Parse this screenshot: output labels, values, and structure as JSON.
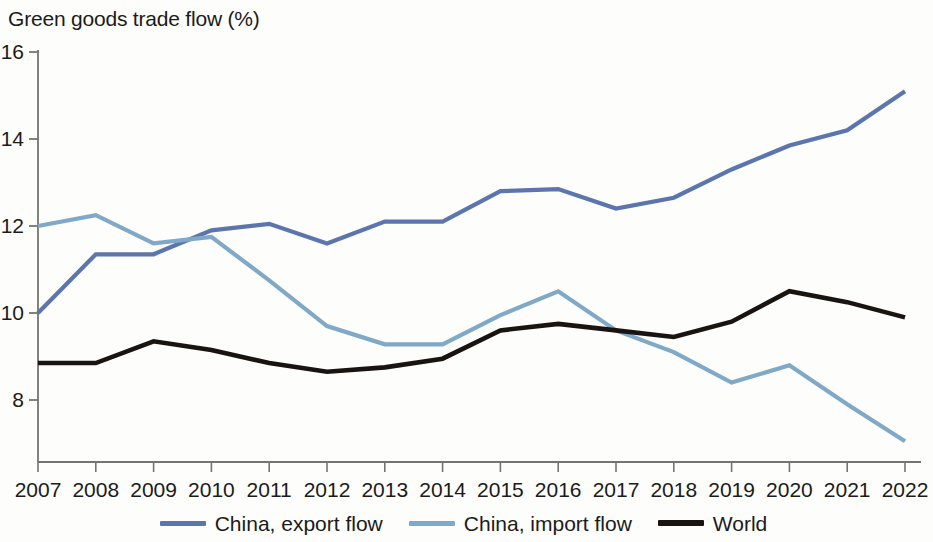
{
  "chart_data": {
    "type": "line",
    "title": "Green goods trade flow (%)",
    "xlabel": "",
    "ylabel": "",
    "x": [
      2007,
      2008,
      2009,
      2010,
      2011,
      2012,
      2013,
      2014,
      2015,
      2016,
      2017,
      2018,
      2019,
      2020,
      2021,
      2022
    ],
    "xtick_labels": [
      "2007",
      "2008",
      "2009",
      "2010",
      "2011",
      "2012",
      "2013",
      "2014",
      "2015",
      "2016",
      "2017",
      "2018",
      "2019",
      "2020",
      "2021",
      "2022"
    ],
    "ytick_labels": [
      "16",
      "14",
      "12",
      "10",
      "8"
    ],
    "yticks": [
      16,
      14,
      12,
      10,
      8
    ],
    "ylim": [
      6.6,
      16
    ],
    "xlim": [
      2007,
      2022
    ],
    "grid": false,
    "legend_position": "bottom",
    "series": [
      {
        "name": "China, export flow",
        "color": "#5c76ad",
        "values": [
          10.0,
          11.35,
          11.35,
          11.9,
          12.05,
          11.6,
          12.1,
          12.1,
          12.8,
          12.85,
          12.4,
          12.65,
          13.3,
          13.85,
          14.2,
          15.1
        ]
      },
      {
        "name": "China, import flow",
        "color": "#7fa9c6",
        "values": [
          12.0,
          12.25,
          11.6,
          11.75,
          10.75,
          9.7,
          9.28,
          9.28,
          9.95,
          10.5,
          9.6,
          9.1,
          8.4,
          8.8,
          7.9,
          7.05
        ]
      },
      {
        "name": "World",
        "color": "#1a1410",
        "values": [
          8.85,
          8.85,
          9.35,
          9.15,
          8.85,
          8.65,
          8.75,
          8.95,
          9.6,
          9.75,
          9.6,
          9.45,
          9.8,
          10.5,
          10.25,
          9.9
        ]
      }
    ]
  },
  "legend": {
    "items": [
      {
        "label": "China, export flow",
        "color": "#5c76ad"
      },
      {
        "label": "China, import flow",
        "color": "#7fa9c6"
      },
      {
        "label": "World",
        "color": "#1a1410"
      }
    ]
  }
}
